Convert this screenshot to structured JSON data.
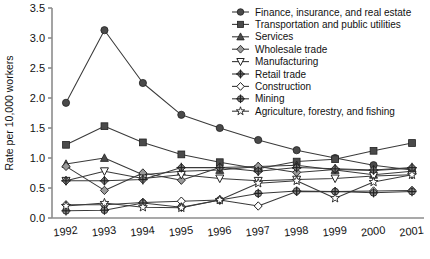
{
  "chart_data": {
    "type": "line",
    "title": "",
    "xlabel": "",
    "ylabel": "Rate per 10,000 workers",
    "x": [
      "1992",
      "1993",
      "1994",
      "1995",
      "1996",
      "1997",
      "1998",
      "1999",
      "2000",
      "2001"
    ],
    "xlim": [
      "1992",
      "2001"
    ],
    "ylim": [
      0.0,
      3.5
    ],
    "yticks": [
      "0.0",
      "0.5",
      "1.0",
      "1.5",
      "2.0",
      "2.5",
      "3.0",
      "3.5"
    ],
    "ytick_values": [
      0.0,
      0.5,
      1.0,
      1.5,
      2.0,
      2.5,
      3.0,
      3.5
    ],
    "grid": false,
    "legend_position": "top-right",
    "series": [
      {
        "name": "Finance, insurance, and real estate",
        "marker": "filled-circle",
        "values": [
          1.92,
          3.13,
          2.25,
          1.72,
          1.5,
          1.3,
          1.13,
          1.0,
          0.88,
          0.8
        ]
      },
      {
        "name": "Transportation and public utilities",
        "marker": "filled-square",
        "values": [
          1.22,
          1.53,
          1.26,
          1.06,
          0.93,
          0.82,
          0.94,
          0.98,
          1.12,
          1.25
        ]
      },
      {
        "name": "Services",
        "marker": "filled-triangle-up",
        "values": [
          0.9,
          1.0,
          0.72,
          0.78,
          0.8,
          0.86,
          0.88,
          0.8,
          0.72,
          0.78
        ]
      },
      {
        "name": "Wholesale trade",
        "marker": "shaded-diamond",
        "values": [
          0.86,
          0.46,
          0.75,
          0.63,
          0.84,
          0.86,
          0.76,
          0.81,
          0.79,
          0.83
        ]
      },
      {
        "name": "Manufacturing",
        "marker": "open-triangle-down",
        "values": [
          0.62,
          0.78,
          0.66,
          0.72,
          0.66,
          0.62,
          0.64,
          0.66,
          0.7,
          0.72
        ]
      },
      {
        "name": "Retail trade",
        "marker": "plus-diamond",
        "values": [
          0.62,
          0.62,
          0.64,
          0.84,
          0.84,
          0.78,
          0.84,
          0.82,
          0.8,
          0.84
        ]
      },
      {
        "name": "Construction",
        "marker": "open-diamond",
        "values": [
          0.22,
          0.22,
          0.26,
          0.28,
          0.3,
          0.2,
          0.44,
          0.44,
          0.45,
          0.46
        ]
      },
      {
        "name": "Mining",
        "marker": "cross-circle",
        "values": [
          0.12,
          0.13,
          0.25,
          0.18,
          0.3,
          0.41,
          0.45,
          0.44,
          0.42,
          0.44
        ]
      },
      {
        "name": "Agriculture, forestry, and fishing",
        "marker": "star",
        "values": [
          0.2,
          0.25,
          0.18,
          0.17,
          0.3,
          0.58,
          0.62,
          0.33,
          0.6,
          0.72
        ]
      }
    ]
  },
  "legend": {
    "items": [
      {
        "label": "Finance, insurance, and real estate"
      },
      {
        "label": "Transportation and public utilities"
      },
      {
        "label": "Services"
      },
      {
        "label": "Wholesale trade"
      },
      {
        "label": "Manufacturing"
      },
      {
        "label": "Retail trade"
      },
      {
        "label": "Construction"
      },
      {
        "label": "Mining"
      },
      {
        "label": "Agriculture, forestry, and fishing"
      }
    ]
  },
  "axes": {
    "y_title": "Rate per 10,000 workers",
    "y_labels": [
      "3.5",
      "3.0",
      "2.5",
      "2.0",
      "1.5",
      "1.0",
      "0.5",
      "0.0"
    ],
    "x_labels": [
      "1992",
      "1993",
      "1994",
      "1995",
      "1996",
      "1997",
      "1998",
      "1999",
      "2000",
      "2001"
    ]
  },
  "colors": {
    "line": "#3a3a3a",
    "marker_fill": "#4a4a4a",
    "marker_open": "#ffffff",
    "axis": "#8c8c8c",
    "text": "#111111"
  },
  "caption": {
    "partial_text": ""
  }
}
